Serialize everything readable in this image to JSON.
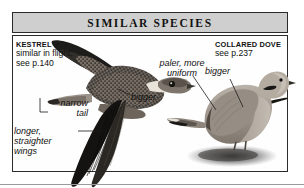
{
  "header": {
    "title": "SIMILAR SPECIES"
  },
  "panel": {
    "kestrel": {
      "name": "KESTREL",
      "symbols": "♂ ♀",
      "line2": "similar in flight;",
      "line3": "see p.140"
    },
    "collared_dove": {
      "name": "COLLARED DOVE",
      "line2": "see p.237"
    },
    "annotations": {
      "paler_line1": "paler, more",
      "paler_line2": "uniform",
      "bigger_left": "bigger",
      "bigger_right": "bigger",
      "narrow_line1": "narrow",
      "narrow_line2": "tail",
      "longer_line1": "longer,",
      "longer_line2": "straighter",
      "longer_line3": "wings"
    },
    "figures": {
      "kestrel_caption": "kestrel-in-flight-illustration",
      "dove_caption": "collared-dove-perched-illustration"
    }
  },
  "colors": {
    "header_band": "#cfcfcf",
    "border": "#2b2b2b",
    "text": "#111111",
    "page": "#ffffff"
  }
}
